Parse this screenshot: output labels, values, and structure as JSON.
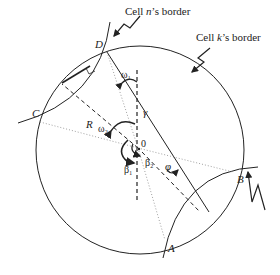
{
  "diagram": {
    "border_labels": {
      "cell_n": "Cell n’s border",
      "cell_k": "Cell k’s border"
    },
    "cell_n_prefix": "Cell ",
    "cell_n_var": "n",
    "cell_n_suffix": "’s border",
    "cell_k_prefix": "Cell ",
    "cell_k_var": "k",
    "cell_k_suffix": "’s border",
    "points": {
      "A": "A",
      "B": "B",
      "C": "C",
      "D": "D",
      "O": "0"
    },
    "labels": {
      "R": "R",
      "gamma": "γ",
      "omega1": "ω₁",
      "omega2": "ω₂",
      "beta1": "β₁",
      "beta2": "β₂",
      "phi": "φ"
    },
    "colors": {
      "stroke": "#222222",
      "dotted": "#777777",
      "background": "#ffffff"
    }
  }
}
